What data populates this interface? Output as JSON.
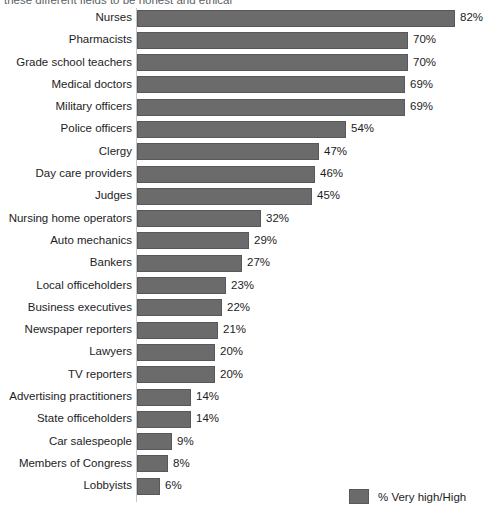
{
  "caption": "these different fields to be honest and ethical",
  "chart_data": {
    "type": "bar",
    "orientation": "horizontal",
    "title": "",
    "subtitle": "these different fields to be honest and ethical",
    "xlabel": "",
    "ylabel": "",
    "xlim": [
      0,
      82
    ],
    "grid": false,
    "value_suffix": "%",
    "legend_position": "bottom-right",
    "legend": [
      "% Very high/High"
    ],
    "series_color": "#6b6b6b",
    "categories": [
      "Nurses",
      "Pharmacists",
      "Grade school teachers",
      "Medical doctors",
      "Military officers",
      "Police officers",
      "Clergy",
      "Day care providers",
      "Judges",
      "Nursing home operators",
      "Auto mechanics",
      "Bankers",
      "Local officeholders",
      "Business executives",
      "Newspaper reporters",
      "Lawyers",
      "TV reporters",
      "Advertising practitioners",
      "State officeholders",
      "Car salespeople",
      "Members of Congress",
      "Lobbyists"
    ],
    "values": [
      82,
      70,
      70,
      69,
      69,
      54,
      47,
      46,
      45,
      32,
      29,
      27,
      23,
      22,
      21,
      20,
      20,
      14,
      14,
      9,
      8,
      6
    ],
    "value_labels": [
      "82%",
      "70%",
      "70%",
      "69%",
      "69%",
      "54%",
      "47%",
      "46%",
      "45%",
      "32%",
      "29%",
      "27%",
      "23%",
      "22%",
      "21%",
      "20%",
      "20%",
      "14%",
      "14%",
      "9%",
      "8%",
      "6%"
    ],
    "series": [
      {
        "name": "% Very high/High",
        "color": "#6b6b6b",
        "values": [
          82,
          70,
          70,
          69,
          69,
          54,
          47,
          46,
          45,
          32,
          29,
          27,
          23,
          22,
          21,
          20,
          20,
          14,
          14,
          9,
          8,
          6
        ]
      }
    ]
  },
  "legend": {
    "items": [
      {
        "label": "% Very high/High",
        "color": "#6b6b6b"
      }
    ]
  }
}
